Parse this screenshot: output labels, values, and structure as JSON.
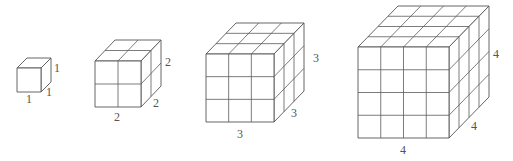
{
  "diagram": {
    "colors": {
      "line": "#555555",
      "label": "#555555",
      "background": "#ffffff"
    },
    "cubes": [
      {
        "n": 1,
        "front": {
          "x": 17,
          "y": 68,
          "size": 24
        },
        "depth": {
          "dx": 10,
          "dy": -10
        },
        "labels": {
          "width": {
            "text": "1",
            "x": 29,
            "y": 99
          },
          "depth": {
            "text": "1",
            "x": 49,
            "y": 92
          },
          "height": {
            "text": "1",
            "x": 57,
            "y": 68
          }
        }
      },
      {
        "n": 2,
        "front": {
          "x": 95,
          "y": 61,
          "size": 46
        },
        "depth": {
          "dx": 20,
          "dy": -21
        },
        "labels": {
          "width": {
            "text": "2",
            "x": 117,
            "y": 117
          },
          "depth": {
            "text": "2",
            "x": 156,
            "y": 103
          },
          "height": {
            "text": "2",
            "x": 168,
            "y": 62
          }
        }
      },
      {
        "n": 3,
        "front": {
          "x": 206,
          "y": 54,
          "size": 68
        },
        "depth": {
          "dx": 30,
          "dy": -31
        },
        "labels": {
          "width": {
            "text": "3",
            "x": 240,
            "y": 134
          },
          "depth": {
            "text": "3",
            "x": 294,
            "y": 113
          },
          "height": {
            "text": "3",
            "x": 316,
            "y": 58
          }
        }
      },
      {
        "n": 4,
        "front": {
          "x": 358,
          "y": 47,
          "size": 91
        },
        "depth": {
          "dx": 40,
          "dy": -41
        },
        "labels": {
          "width": {
            "text": "4",
            "x": 403,
            "y": 150
          },
          "depth": {
            "text": "4",
            "x": 474,
            "y": 126
          },
          "height": {
            "text": "4",
            "x": 496,
            "y": 54
          }
        }
      }
    ]
  }
}
